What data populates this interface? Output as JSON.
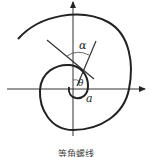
{
  "figure": {
    "labels": {
      "alpha": "α",
      "theta": "θ",
      "a": "a"
    },
    "caption": "等角螺线",
    "colors": {
      "stroke": "#222222",
      "background": "#ffffff"
    }
  }
}
